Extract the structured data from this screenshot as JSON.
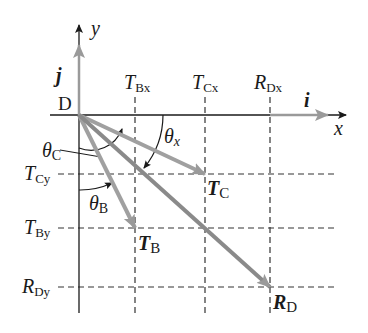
{
  "diagram": {
    "origin_label": "D",
    "axes": {
      "x_label": "x",
      "y_label": "y",
      "i_label": "i",
      "j_label": "j"
    },
    "vectors": [
      {
        "name": "T_C",
        "label_main": "T",
        "label_sub": "C",
        "from": [
          79,
          115
        ],
        "to": [
          205,
          174
        ]
      },
      {
        "name": "T_B",
        "label_main": "T",
        "label_sub": "B",
        "from": [
          79,
          115
        ],
        "to": [
          135,
          228
        ]
      },
      {
        "name": "R_D",
        "label_main": "R",
        "label_sub": "D",
        "from": [
          79,
          115
        ],
        "to": [
          270,
          287
        ]
      }
    ],
    "component_labels": {
      "TBx": {
        "main": "T",
        "sub": "Bx"
      },
      "TCx": {
        "main": "T",
        "sub": "Cx"
      },
      "RDx": {
        "main": "R",
        "sub": "Dx"
      },
      "TCy": {
        "main": "T",
        "sub": "Cy"
      },
      "TBy": {
        "main": "T",
        "sub": "By"
      },
      "RDy": {
        "main": "R",
        "sub": "Dy"
      }
    },
    "angles": {
      "theta_C": {
        "main": "θ",
        "sub": "C"
      },
      "theta_B": {
        "main": "θ",
        "sub": "B"
      },
      "theta_x": {
        "main": "θ",
        "sub": "x"
      }
    },
    "colors": {
      "axis": "#1a1a1a",
      "vector": "#9a9a9a",
      "vector_dark": "#8a8a8a",
      "dashed": "#333333"
    }
  }
}
